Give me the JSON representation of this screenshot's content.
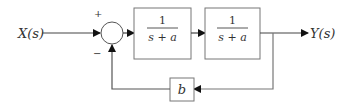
{
  "diagram": {
    "type": "feedback-block-diagram",
    "input_label": "X(s)",
    "output_label": "Y(s)",
    "summing_junction": {
      "plus_sign": "+",
      "minus_sign": "−"
    },
    "forward_blocks": [
      {
        "numerator": "1",
        "denominator": "s + a"
      },
      {
        "numerator": "1",
        "denominator": "s + a"
      }
    ],
    "feedback_block": {
      "label": "b"
    },
    "colors": {
      "line": "#444444",
      "arrow": "#111111",
      "box": "#666666"
    }
  }
}
